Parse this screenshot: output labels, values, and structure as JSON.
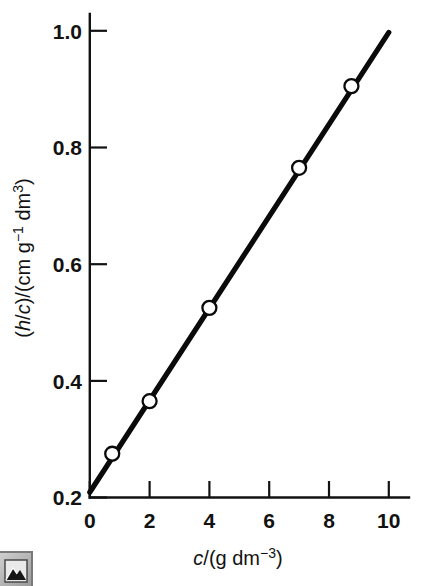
{
  "figure": {
    "background_color": "#ffffff",
    "ink_color": "#121212"
  },
  "chart_data": {
    "type": "scatter",
    "title": "",
    "subtitle": "",
    "xlabel_parts": {
      "symbol": "c",
      "rest": "/(g dm",
      "exponent": "−3",
      "close": ")"
    },
    "xlabel": "c/(g dm−3)",
    "ylabel_parts": {
      "open": "(",
      "symbol1": "h",
      "slash1": "/",
      "symbol2": "c",
      "mid": ")/(cm g",
      "exponent1": "−1",
      "mid2": " dm",
      "exponent2": "3",
      "close": ")"
    },
    "ylabel": "(h/c)/(cm g−1 dm3)",
    "x": [
      0.75,
      2.0,
      4.0,
      7.0,
      8.75
    ],
    "values": [
      0.275,
      0.365,
      0.525,
      0.765,
      0.905
    ],
    "series": [
      {
        "name": "h/c vs c",
        "x": [
          0.75,
          2.0,
          4.0,
          7.0,
          8.75
        ],
        "values": [
          0.275,
          0.365,
          0.525,
          0.765,
          0.905
        ]
      }
    ],
    "fit_line": {
      "type": "linear",
      "intercept": 0.209,
      "slope": 0.0788,
      "x_start": 0.0,
      "x_end": 10.0,
      "y_start": 0.209,
      "y_end": 0.997
    },
    "xlim": [
      0,
      10.6
    ],
    "ylim": [
      0.2,
      1.04
    ],
    "xticks": [
      0,
      2,
      4,
      6,
      8,
      10
    ],
    "xtick_labels": [
      "0",
      "2",
      "4",
      "6",
      "8",
      "10"
    ],
    "yticks": [
      0.2,
      0.4,
      0.6,
      0.8,
      1.0
    ],
    "ytick_labels": [
      "0.2",
      "0.4",
      "0.6",
      "0.8",
      "1.0"
    ],
    "grid": false,
    "legend": null,
    "tick_direction": "in",
    "marker_style": "open-circle",
    "marker_size_px": 14,
    "line_color": "#0a0a0a",
    "marker_fill": "#ffffff"
  },
  "artifact": {
    "name": "broken-image-icon",
    "description": "partial grey image placeholder icon at bottom-left corner"
  }
}
